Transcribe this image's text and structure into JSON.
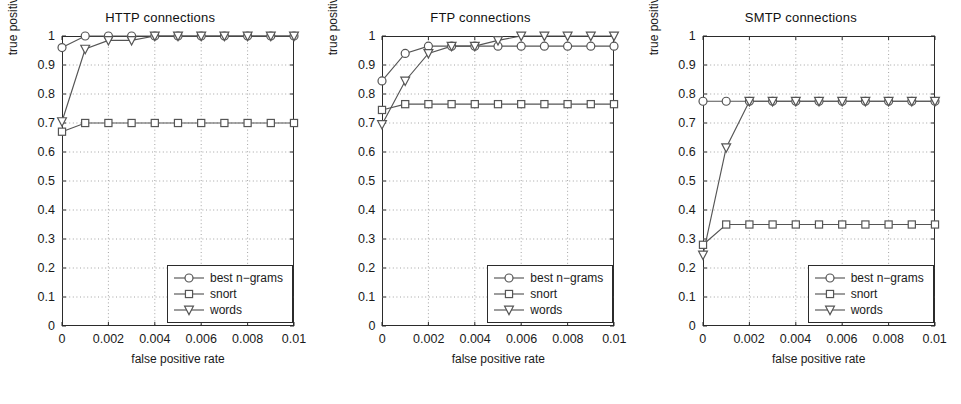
{
  "figure": {
    "axis_labels": {
      "x": "false positive rate",
      "y": "true positive rate"
    },
    "y_ticks": [
      "0",
      "0.1",
      "0.2",
      "0.3",
      "0.4",
      "0.5",
      "0.6",
      "0.7",
      "0.8",
      "0.9",
      "1"
    ],
    "x_ticks": [
      "0",
      "0.002",
      "0.004",
      "0.006",
      "0.008",
      "0.01"
    ],
    "legend": {
      "items": [
        {
          "label": "best n−grams",
          "marker": "circle-marker"
        },
        {
          "label": "snort",
          "marker": "square-marker"
        },
        {
          "label": "words",
          "marker": "triangle-down-marker"
        }
      ]
    },
    "colors": {
      "axis": "#2b2b2b",
      "grid": "#9a9a9a",
      "series": "#555555"
    }
  },
  "chart_data": [
    {
      "type": "line",
      "title": "HTTP connections",
      "xlabel": "false positive rate",
      "ylabel": "true positive rate",
      "xlim": [
        0,
        0.01
      ],
      "ylim": [
        0,
        1
      ],
      "xticks": [
        0,
        0.002,
        0.004,
        0.006,
        0.008,
        0.01
      ],
      "yticks": [
        0,
        0.1,
        0.2,
        0.3,
        0.4,
        0.5,
        0.6,
        0.7,
        0.8,
        0.9,
        1
      ],
      "grid": true,
      "legend_position": "lower right",
      "x": [
        0,
        0.001,
        0.002,
        0.003,
        0.004,
        0.005,
        0.006,
        0.007,
        0.008,
        0.009,
        0.01
      ],
      "series": [
        {
          "name": "best n−grams",
          "marker": "circle",
          "values": [
            0.96,
            1.0,
            1.0,
            1.0,
            1.0,
            1.0,
            1.0,
            1.0,
            1.0,
            1.0,
            1.0
          ]
        },
        {
          "name": "snort",
          "marker": "square",
          "values": [
            0.67,
            0.7,
            0.7,
            0.7,
            0.7,
            0.7,
            0.7,
            0.7,
            0.7,
            0.7,
            0.7
          ]
        },
        {
          "name": "words",
          "marker": "triangle-down",
          "values": [
            0.705,
            0.955,
            0.985,
            0.985,
            1.0,
            1.0,
            1.0,
            1.0,
            1.0,
            1.0,
            1.0
          ]
        }
      ]
    },
    {
      "type": "line",
      "title": "FTP connections",
      "xlabel": "false positive rate",
      "ylabel": "true positive rate",
      "xlim": [
        0,
        0.01
      ],
      "ylim": [
        0,
        1
      ],
      "xticks": [
        0,
        0.002,
        0.004,
        0.006,
        0.008,
        0.01
      ],
      "yticks": [
        0,
        0.1,
        0.2,
        0.3,
        0.4,
        0.5,
        0.6,
        0.7,
        0.8,
        0.9,
        1
      ],
      "grid": true,
      "legend_position": "lower right",
      "x": [
        0,
        0.001,
        0.002,
        0.003,
        0.004,
        0.005,
        0.006,
        0.007,
        0.008,
        0.009,
        0.01
      ],
      "series": [
        {
          "name": "best n−grams",
          "marker": "circle",
          "values": [
            0.845,
            0.94,
            0.965,
            0.965,
            0.965,
            0.965,
            0.965,
            0.965,
            0.965,
            0.965,
            0.965
          ]
        },
        {
          "name": "snort",
          "marker": "square",
          "values": [
            0.745,
            0.765,
            0.765,
            0.765,
            0.765,
            0.765,
            0.765,
            0.765,
            0.765,
            0.765,
            0.765
          ]
        },
        {
          "name": "words",
          "marker": "triangle-down",
          "values": [
            0.695,
            0.845,
            0.94,
            0.965,
            0.965,
            0.985,
            1.0,
            1.0,
            1.0,
            1.0,
            1.0
          ]
        }
      ]
    },
    {
      "type": "line",
      "title": "SMTP connections",
      "xlabel": "false positive rate",
      "ylabel": "true positive rate",
      "xlim": [
        0,
        0.01
      ],
      "ylim": [
        0,
        1
      ],
      "xticks": [
        0,
        0.002,
        0.004,
        0.006,
        0.008,
        0.01
      ],
      "yticks": [
        0,
        0.1,
        0.2,
        0.3,
        0.4,
        0.5,
        0.6,
        0.7,
        0.8,
        0.9,
        1
      ],
      "grid": true,
      "legend_position": "lower right",
      "x": [
        0,
        0.001,
        0.002,
        0.003,
        0.004,
        0.005,
        0.006,
        0.007,
        0.008,
        0.009,
        0.01
      ],
      "series": [
        {
          "name": "best n−grams",
          "marker": "circle",
          "values": [
            0.775,
            0.775,
            0.775,
            0.775,
            0.775,
            0.775,
            0.775,
            0.775,
            0.775,
            0.775,
            0.775
          ]
        },
        {
          "name": "snort",
          "marker": "square",
          "values": [
            0.28,
            0.35,
            0.35,
            0.35,
            0.35,
            0.35,
            0.35,
            0.35,
            0.35,
            0.35,
            0.35
          ]
        },
        {
          "name": "words",
          "marker": "triangle-down",
          "values": [
            0.245,
            0.615,
            0.775,
            0.775,
            0.775,
            0.775,
            0.775,
            0.775,
            0.775,
            0.775,
            0.775
          ]
        }
      ]
    }
  ]
}
